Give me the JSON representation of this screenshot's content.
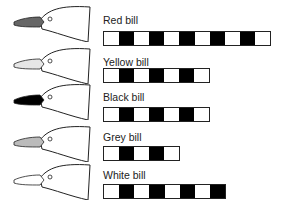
{
  "rows": [
    {
      "label": "Red bill",
      "bill_color": "#666666",
      "segments": 11,
      "pattern": "wbwbwbwbwbw"
    },
    {
      "label": "Yellow bill",
      "bill_color": "#e6e6e6",
      "segments": 7,
      "pattern": "wbwbwbw"
    },
    {
      "label": "Black bill",
      "bill_color": "#000000",
      "segments": 7,
      "pattern": "wbwbwbw"
    },
    {
      "label": "Grey bill",
      "bill_color": "#bbbbbb",
      "segments": 5,
      "pattern": "wbwbw"
    },
    {
      "label": "White bill",
      "bill_color": "#ffffff",
      "segments": 8,
      "pattern": "wbwbwbwb"
    }
  ]
}
